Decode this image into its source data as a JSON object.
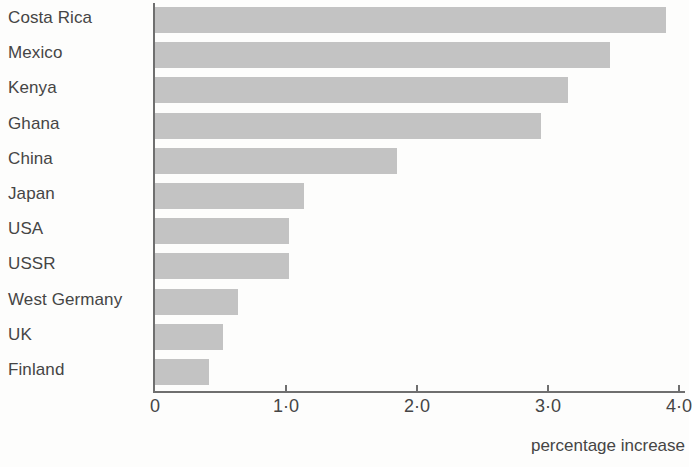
{
  "chart_data": {
    "type": "bar",
    "orientation": "horizontal",
    "title": "",
    "xlabel": "percentage increase",
    "ylabel": "",
    "xlim": [
      0,
      4.15
    ],
    "grid": false,
    "legend": null,
    "xticks": [
      {
        "value": 0,
        "label": "0"
      },
      {
        "value": 1,
        "label": "1·0"
      },
      {
        "value": 2,
        "label": "2·0"
      },
      {
        "value": 3,
        "label": "3·0"
      },
      {
        "value": 4,
        "label": "4·0"
      }
    ],
    "categories": [
      "Costa Rica",
      "Mexico",
      "Kenya",
      "Ghana",
      "China",
      "Japan",
      "USA",
      "USSR",
      "West Germany",
      "UK",
      "Finland"
    ],
    "values": [
      3.9,
      3.47,
      3.15,
      2.95,
      1.85,
      1.14,
      1.02,
      1.02,
      0.63,
      0.52,
      0.41
    ],
    "bar_color": "#c3c3c3",
    "axis_color": "#6f6f6f",
    "text_color": "#454545",
    "background": "#fdfdfc"
  },
  "axis": {
    "caption": "percentage increase"
  }
}
